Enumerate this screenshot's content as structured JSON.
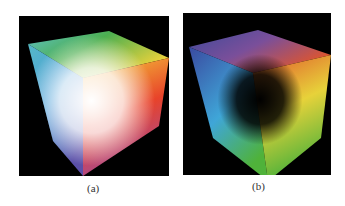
{
  "figure": {
    "panels": [
      {
        "id": "a",
        "caption": "(a)",
        "description": "RGB color cube viewed from the white corner",
        "colors": {
          "top": "#4caf50",
          "top_left": "#4fb3c8",
          "top_right": "#f2d43a",
          "center": "#ffffff",
          "right": "#e8432a",
          "bottom_left": "#4b5fb0",
          "bottom": "#8a4fa0",
          "background": "#000000"
        }
      },
      {
        "id": "b",
        "caption": "(b)",
        "description": "RGB color cube viewed from the black corner",
        "colors": {
          "top": "#7a4f9a",
          "top_left": "#3e4a9a",
          "top_right": "#e0552c",
          "center": "#000000",
          "left": "#3fa6d8",
          "right": "#e7d23a",
          "bottom": "#4fb23a",
          "background": "#000000"
        }
      }
    ]
  }
}
